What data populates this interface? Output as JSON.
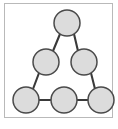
{
  "figure": {
    "title": "",
    "caption": "",
    "border_color": "#b9b9b9",
    "background_color": "#ffffff"
  },
  "graph_data": {
    "type": "node-link-diagram",
    "node_count": 6,
    "edge_count": 6,
    "node_fill_color": "#dcdcdc",
    "node_stroke_color": "#4a4a4a",
    "edge_color": "#3a3a3a",
    "node_radius": 13,
    "nodes": [
      {
        "id": "n0",
        "label": "",
        "cx": 67,
        "cy": 23,
        "r": 13,
        "row": "top"
      },
      {
        "id": "n1",
        "label": "",
        "cx": 46,
        "cy": 62,
        "r": 13,
        "row": "middle-left"
      },
      {
        "id": "n2",
        "label": "",
        "cx": 84,
        "cy": 62,
        "r": 13,
        "row": "middle-right"
      },
      {
        "id": "n3",
        "label": "",
        "cx": 26,
        "cy": 100,
        "r": 13,
        "row": "bottom-left"
      },
      {
        "id": "n4",
        "label": "",
        "cx": 64,
        "cy": 100,
        "r": 13,
        "row": "bottom-center"
      },
      {
        "id": "n5",
        "label": "",
        "cx": 101,
        "cy": 100,
        "r": 13,
        "row": "bottom-right"
      }
    ],
    "edges": [
      {
        "id": "e0",
        "source": "n0",
        "target": "n1",
        "x1": 60,
        "y1": 34,
        "x2": 53,
        "y2": 51
      },
      {
        "id": "e1",
        "source": "n0",
        "target": "n2",
        "x1": 74,
        "y1": 34,
        "x2": 78,
        "y2": 51
      },
      {
        "id": "e2",
        "source": "n1",
        "target": "n3",
        "x1": 39,
        "y1": 73,
        "x2": 33,
        "y2": 89
      },
      {
        "id": "e3",
        "source": "n2",
        "target": "n5",
        "x1": 91,
        "y1": 73,
        "x2": 95,
        "y2": 89
      },
      {
        "id": "e4",
        "source": "n3",
        "target": "n4",
        "x1": 39,
        "y1": 100,
        "x2": 51,
        "y2": 100
      },
      {
        "id": "e5",
        "source": "n4",
        "target": "n5",
        "x1": 77,
        "y1": 100,
        "x2": 88,
        "y2": 100
      }
    ]
  }
}
